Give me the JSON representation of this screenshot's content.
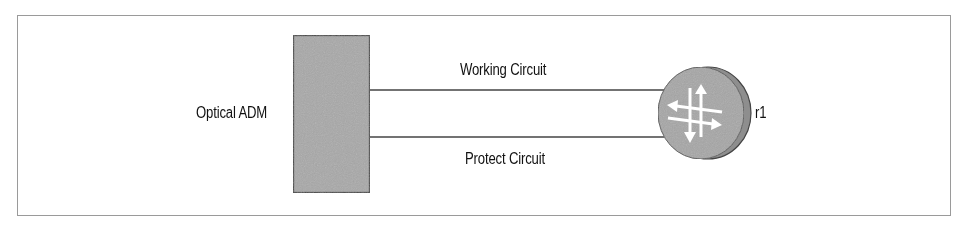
{
  "diagram": {
    "nodes": {
      "adm": {
        "label": "Optical ADM",
        "fill": "#a8a8a8",
        "stroke": "#444444"
      },
      "router": {
        "label": "r1",
        "fill": "#a6a6a6",
        "edge": "#8c8c8c",
        "arrow_color": "#ffffff"
      }
    },
    "links": [
      {
        "label": "Working Circuit",
        "from": "adm",
        "to": "router"
      },
      {
        "label": "Protect Circuit",
        "from": "adm",
        "to": "router"
      }
    ],
    "frame_color": "#9a9a9a"
  }
}
